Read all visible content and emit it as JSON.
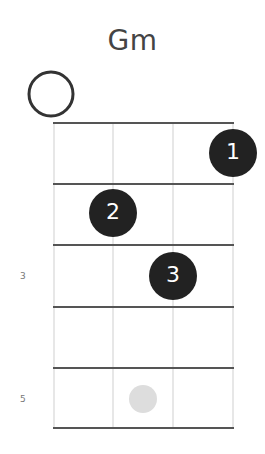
{
  "chord": {
    "name": "Gm",
    "open_strings": [
      1
    ],
    "fret_numbers": [
      {
        "label": "3",
        "fret": 3
      },
      {
        "label": "5",
        "fret": 5
      }
    ],
    "fingers": [
      {
        "label": "1",
        "string": 4,
        "fret": 1
      },
      {
        "label": "2",
        "string": 2,
        "fret": 2
      },
      {
        "label": "3",
        "string": 3,
        "fret": 3
      }
    ],
    "inlay": {
      "fret": 5,
      "position": "between-strings-2-3"
    },
    "colors": {
      "finger_dot": "#222222",
      "finger_text": "#ffffff",
      "fret_line": "#555555",
      "string_line": "#cccccc",
      "inlay": "#dddddd"
    }
  }
}
